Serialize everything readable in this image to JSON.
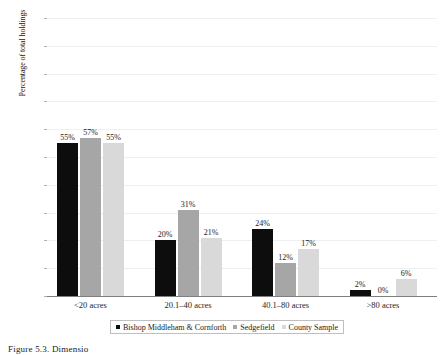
{
  "chart_data": {
    "type": "bar",
    "title": "",
    "xlabel": "",
    "ylabel": "Percentage of total holdings",
    "ylim": [
      0,
      1
    ],
    "ytick_labels": [
      "0",
      "0.1",
      "0.2",
      "0.3",
      "0.4",
      "0.5",
      "0.6",
      "0.7",
      "0.8",
      "0.9",
      "1"
    ],
    "ytick_values": [
      0,
      0.1,
      0.2,
      0.3,
      0.4,
      0.5,
      0.6,
      0.7,
      0.8,
      0.9,
      1
    ],
    "grid": true,
    "legend_position": "bottom",
    "categories": [
      "<20 acres",
      "20.1–40 acres",
      "40.1–80 acres",
      ">80 acres"
    ],
    "series": [
      {
        "name": "Bishop Middleham & Cornforth",
        "color": "#0d0d0d",
        "values": [
          0.55,
          0.2,
          0.24,
          0.02
        ],
        "labels": [
          "55%",
          "20%",
          "24%",
          "2%"
        ]
      },
      {
        "name": "Sedgefield",
        "color": "#a6a6a6",
        "values": [
          0.57,
          0.31,
          0.12,
          0.0
        ],
        "labels": [
          "57%",
          "31%",
          "12%",
          "0%"
        ]
      },
      {
        "name": "County Sample",
        "color": "#d9d9d9",
        "values": [
          0.55,
          0.21,
          0.17,
          0.06
        ],
        "labels": [
          "55%",
          "21%",
          "17%",
          "6%"
        ]
      }
    ]
  },
  "caption": "Figure 5.3. Dimensio"
}
